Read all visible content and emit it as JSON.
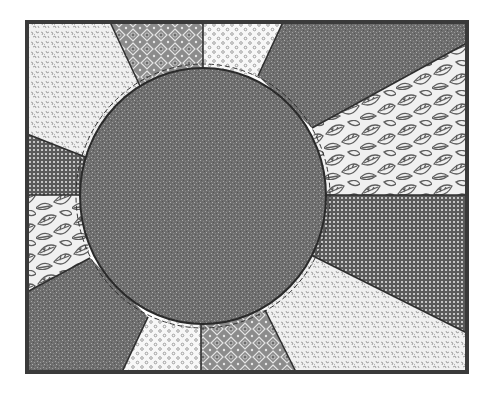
{
  "diagram": {
    "type": "quilt-block",
    "canvas": {
      "width": 494,
      "height": 394,
      "background": "#ffffff"
    },
    "frame": {
      "x": 27,
      "y": 22,
      "width": 440,
      "height": 350,
      "stroke": "#3a3a3a",
      "stroke_width": 4
    },
    "center_circle": {
      "cx": 203,
      "cy": 196,
      "rx": 123,
      "ry": 128,
      "fabric": "speckled-dark",
      "stroke": "#2a2a2a",
      "stitch_line": "dashed"
    },
    "colors": {
      "speckled_dark": "#6e6e6e",
      "speckled_dark_light": "#9a9a9a",
      "floral_light_bg": "#f2f2f2",
      "floral_light_fg": "#9c9c9c",
      "medallion_bg": "#8c8c8c",
      "medallion_fg": "#e8e8e8",
      "dots_bg": "#f7f7f7",
      "dots_fg": "#8a8a8a",
      "check_bg": "#5a5a5a",
      "check_fg": "#c8c8c8",
      "leaf_bg": "#f0f0f0",
      "leaf_fg": "#5e5e5e",
      "seam": "#2e2e2e"
    },
    "wedges": [
      {
        "id": "top-left-floral",
        "fabric": "floral-light"
      },
      {
        "id": "top-medallion",
        "fabric": "medallion"
      },
      {
        "id": "top-dots",
        "fabric": "dots"
      },
      {
        "id": "top-right-dark",
        "fabric": "speckled-dark"
      },
      {
        "id": "right-upper-leaf",
        "fabric": "leaf"
      },
      {
        "id": "right-lower-check",
        "fabric": "check"
      },
      {
        "id": "bottom-right-floral",
        "fabric": "floral-light"
      },
      {
        "id": "bottom-medallion",
        "fabric": "medallion"
      },
      {
        "id": "bottom-dots",
        "fabric": "dots"
      },
      {
        "id": "bottom-left-dark",
        "fabric": "speckled-dark"
      },
      {
        "id": "left-lower-leaf",
        "fabric": "leaf"
      },
      {
        "id": "left-upper-check",
        "fabric": "check"
      }
    ]
  }
}
